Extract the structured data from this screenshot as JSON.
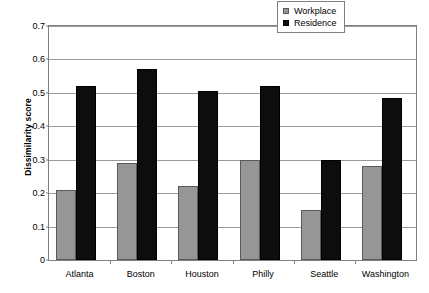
{
  "chart_data": {
    "type": "bar",
    "title": "",
    "xlabel": "",
    "ylabel": "Dissimilarity score",
    "ylim": [
      0,
      0.7
    ],
    "yticks": [
      "0",
      "0.1",
      "0.2",
      "0.3",
      "0.4",
      "0.5",
      "0.6",
      "0.7"
    ],
    "ytick_values": [
      0,
      0.1,
      0.2,
      0.3,
      0.4,
      0.5,
      0.6,
      0.7
    ],
    "grid": true,
    "legend_position": "top-right",
    "categories": [
      "Atlanta",
      "Boston",
      "Houston",
      "Philly",
      "Seattle",
      "Washington"
    ],
    "series": [
      {
        "name": "Workplace",
        "color": "#969696",
        "values": [
          0.21,
          0.29,
          0.22,
          0.3,
          0.15,
          0.28
        ]
      },
      {
        "name": "Residence",
        "color": "#0d0d0d",
        "values": [
          0.52,
          0.57,
          0.505,
          0.52,
          0.3,
          0.485
        ]
      }
    ]
  },
  "legend": {
    "items": [
      {
        "label": "Workplace",
        "color": "#969696"
      },
      {
        "label": "Residence",
        "color": "#0d0d0d"
      }
    ]
  }
}
